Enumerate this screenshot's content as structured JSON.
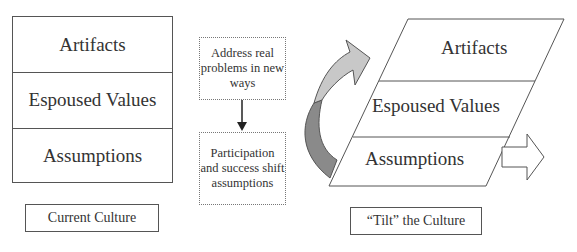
{
  "current_culture": {
    "layers": [
      "Artifacts",
      "Espoused Values",
      "Assumptions"
    ],
    "caption": "Current Culture"
  },
  "process": {
    "step1": "Address real problems in new ways",
    "step2": "Participation and success shift assumptions"
  },
  "tilted_culture": {
    "layers": [
      "Artifacts",
      "Espoused Values",
      "Assumptions"
    ],
    "caption": "“Tilt” the Culture"
  },
  "colors": {
    "curved_arrow_top": "#c8c8c8",
    "curved_arrow_bottom": "#8a8a8a",
    "outline": "#555555"
  }
}
